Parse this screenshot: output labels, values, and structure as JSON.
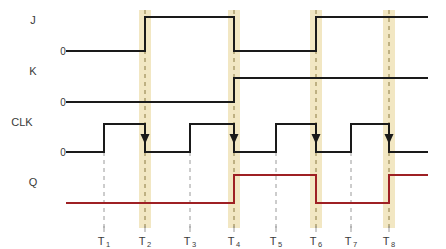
{
  "diagram": {
    "background_color": "#ffffff",
    "signal_color": "#1a1a1a",
    "q_color": "#9e2024",
    "highlight_color": "#f2e7c3",
    "dashed_color": "#9a9a9a",
    "canvas": {
      "width": 446,
      "height": 249
    }
  },
  "signals": [
    {
      "name": "J",
      "label": "J",
      "label_x": 33,
      "label_y": 24,
      "zero_label": "0",
      "zero_x": 63,
      "zero_y": 55,
      "low_y": 51,
      "high_y": 17,
      "color": "#1a1a1a"
    },
    {
      "name": "K",
      "label": "K",
      "label_x": 33,
      "label_y": 75,
      "zero_label": "0",
      "zero_x": 63,
      "zero_y": 106,
      "low_y": 102,
      "high_y": 78,
      "color": "#1a1a1a"
    },
    {
      "name": "CLK",
      "label": "CLK",
      "label_x": 22,
      "label_y": 126,
      "zero_label": "0",
      "zero_x": 63,
      "zero_y": 156,
      "low_y": 152,
      "high_y": 124,
      "color": "#1a1a1a"
    },
    {
      "name": "Q",
      "label": "Q",
      "label_x": 33,
      "label_y": 186,
      "zero_label": "",
      "zero_x": 0,
      "zero_y": 0,
      "low_y": 203,
      "high_y": 175,
      "color": "#9e2024"
    }
  ],
  "time_markers": [
    {
      "label": "T",
      "sub": "1",
      "x": 104,
      "highlighted": false
    },
    {
      "label": "T",
      "sub": "2",
      "x": 145,
      "highlighted": true
    },
    {
      "label": "T",
      "sub": "3",
      "x": 190,
      "highlighted": false
    },
    {
      "label": "T",
      "sub": "4",
      "x": 234,
      "highlighted": true
    },
    {
      "label": "T",
      "sub": "5",
      "x": 276,
      "highlighted": false
    },
    {
      "label": "T",
      "sub": "6",
      "x": 316,
      "highlighted": true
    },
    {
      "label": "T",
      "sub": "7",
      "x": 351,
      "highlighted": false
    },
    {
      "label": "T",
      "sub": "8",
      "x": 389,
      "highlighted": true
    }
  ],
  "waveform_points": {
    "J": "66,51 145,51 145,17 234,17 234,51 316,51 316,17 428,17",
    "K": "66,102 234,102 234,78 428,78",
    "CLK": "66,152 104,152 104,124 145,124 145,152 190,152 190,124 234,124 234,152 276,152 276,124 316,124 316,152 351,152 351,124 389,124 389,152 428,152",
    "Q": "66,203 234,203 234,175 316,175 316,203 389,203 389,175 428,175"
  },
  "clock_edge_arrows": [
    {
      "x": 145,
      "y": 141
    },
    {
      "x": 234,
      "y": 141
    },
    {
      "x": 316,
      "y": 141
    },
    {
      "x": 389,
      "y": 141
    }
  ],
  "axis": {
    "signal_start_x": 66,
    "signal_end_x": 428,
    "highlight_top_y": 10,
    "highlight_bottom_y": 228,
    "dashed_top_y": 152,
    "dashed_bottom_y": 228,
    "tick_bottom_y": 232,
    "label_baseline_y": 245
  }
}
